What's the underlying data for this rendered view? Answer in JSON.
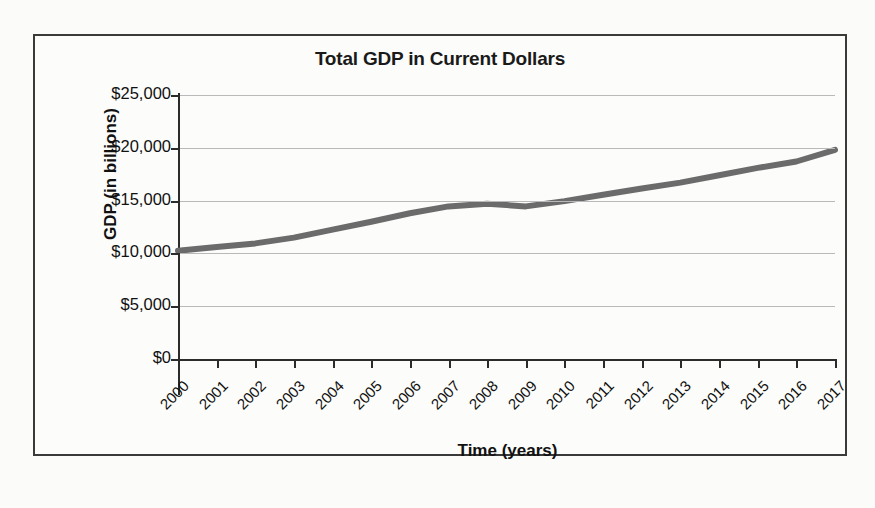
{
  "figure": {
    "title": "Total GDP in Current Dollars",
    "xlabel": "Time (years)",
    "ylabel": "GDP (in billions)"
  },
  "chart_data": {
    "type": "line",
    "title": "Total GDP in Current Dollars",
    "xlabel": "Time (years)",
    "ylabel": "GDP (in billions)",
    "x": [
      2000,
      2001,
      2002,
      2003,
      2004,
      2005,
      2006,
      2007,
      2008,
      2009,
      2010,
      2011,
      2012,
      2013,
      2014,
      2015,
      2016,
      2017
    ],
    "categories": [
      "2000",
      "2001",
      "2002",
      "2003",
      "2004",
      "2005",
      "2006",
      "2007",
      "2008",
      "2009",
      "2010",
      "2011",
      "2012",
      "2013",
      "2014",
      "2015",
      "2016",
      "2017"
    ],
    "series": [
      {
        "name": "Total GDP in Current Dollars",
        "values": [
          10250,
          10600,
          10950,
          11500,
          12250,
          13000,
          13800,
          14450,
          14700,
          14450,
          14950,
          15550,
          16150,
          16700,
          17400,
          18100,
          18700,
          19800
        ],
        "color": "#6b6b6b"
      }
    ],
    "xlim": [
      2000,
      2017
    ],
    "ylim": [
      0,
      25000
    ],
    "yticks": [
      0,
      5000,
      10000,
      15000,
      20000,
      25000
    ],
    "ytick_labels": [
      "$0",
      "$5,000",
      "$10,000",
      "$15,000",
      "$20,000",
      "$25,000"
    ],
    "xtick_labels": [
      "2000",
      "2001",
      "2002",
      "2003",
      "2004",
      "2005",
      "2006",
      "2007",
      "2008",
      "2009",
      "2010",
      "2011",
      "2012",
      "2013",
      "2014",
      "2015",
      "2016",
      "2017"
    ],
    "xtick_rotation": -45,
    "grid": "horizontal",
    "legend": "none",
    "gridline_color": "#b9b9b9",
    "axis_color": "#2b2b2b",
    "line_width_px": 6
  }
}
